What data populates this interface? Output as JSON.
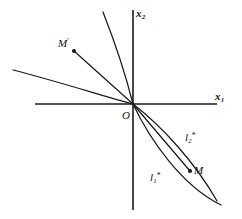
{
  "figure": {
    "background_color": "#ffffff",
    "stroke_color": "#1a1a1a",
    "width": 242,
    "height": 219
  },
  "axes": {
    "x_axis": {
      "label": "x",
      "subscript": "1",
      "from": [
        35,
        104
      ],
      "to": [
        217,
        104
      ]
    },
    "y_axis": {
      "label": "x",
      "subscript": "2",
      "from": [
        133,
        10
      ],
      "to": [
        133,
        210
      ]
    },
    "origin": {
      "label": "O",
      "x": 133,
      "y": 104
    }
  },
  "points": [
    {
      "name": "M-prime",
      "label": "M",
      "superscript": "'",
      "x": 74,
      "y": 51
    },
    {
      "name": "M",
      "label": "M",
      "superscript": "",
      "x": 190,
      "y": 171
    }
  ],
  "curve_labels": [
    {
      "name": "l1-star",
      "label": "l",
      "subscript": "1",
      "superscript": "*",
      "x": 150,
      "y": 172
    },
    {
      "name": "l2-star",
      "label": "l",
      "subscript": "2",
      "superscript": "*",
      "x": 185,
      "y": 132
    }
  ],
  "curves": {
    "upper_left": [
      {
        "name": "steep-curve-upper",
        "path": "M 133 104 C 126 76 114 40 103 12"
      },
      {
        "name": "ray-to-m-prime",
        "path": "M 133 104 L 74 51"
      },
      {
        "name": "flat-curve-left",
        "path": "M 133 104 C 106 97 60 82 13 70"
      }
    ],
    "lower_right": [
      {
        "name": "l1-star-curve",
        "path": "M 133 104 C 150 140 182 186 221 205"
      },
      {
        "name": "l2-star-curve",
        "path": "M 133 104 C 163 127 196 164 217 201"
      },
      {
        "name": "ray-to-m",
        "path": "M 133 104 L 190 171"
      }
    ]
  }
}
